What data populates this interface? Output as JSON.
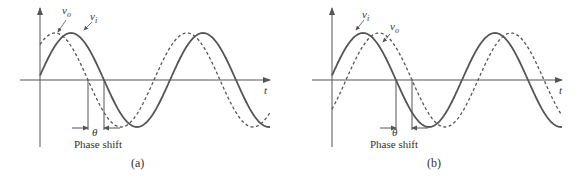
{
  "figure": {
    "panels": [
      {
        "id": "a",
        "caption": "(a)",
        "axis_label": "t",
        "solid_label": "v_i",
        "dashed_label": "v_o",
        "phase_label": "θ",
        "phase_text": "Phase shift",
        "relation": "v_o leads v_i"
      },
      {
        "id": "b",
        "caption": "(b)",
        "axis_label": "t",
        "solid_label": "v_i",
        "dashed_label": "v_o",
        "phase_label": "θ",
        "phase_text": "Phase shift",
        "relation": "v_o lags v_i"
      }
    ],
    "colors": {
      "solid": "#555555",
      "dashed": "#555555",
      "axis": "#555555",
      "text": "#333333"
    }
  }
}
